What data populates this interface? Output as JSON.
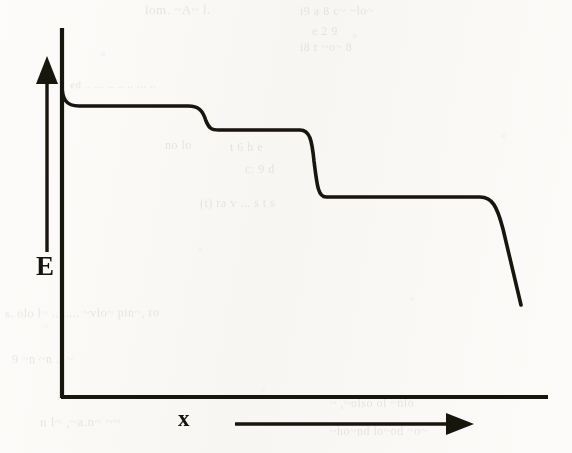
{
  "figure": {
    "kind": "hand-drawn-scanned-plot",
    "background_color": "#fbfaf8",
    "ink_color": "#17140f"
  },
  "axes": {
    "y_label": "E",
    "x_label": "x",
    "y_axis_arrow": "up-arrow-icon",
    "x_axis_arrow": "right-arrow-icon"
  },
  "ghost_text": [
    {
      "text": "lom. ~A~ l.",
      "left": 145,
      "top": 2,
      "size": 13,
      "rot": -0.6
    },
    {
      "text": "i9    a    8      c~    ~lo~",
      "left": 300,
      "top": 4,
      "size": 12,
      "rot": -0.4
    },
    {
      "text": "e    2    9",
      "left": 312,
      "top": 24,
      "size": 12,
      "rot": -0.5
    },
    {
      "text": "i8    r    ~o~    8",
      "left": 300,
      "top": 40,
      "size": 12,
      "rot": -0.3
    },
    {
      "text": "ed  ..   ...  .. ..   ..  ...  ..",
      "left": 70,
      "top": 78,
      "size": 11,
      "rot": -0.5
    },
    {
      "text": "no    lo",
      "left": 165,
      "top": 138,
      "size": 12,
      "rot": -0.4
    },
    {
      "text": "t     6     h     e",
      "left": 230,
      "top": 140,
      "size": 12,
      "rot": -0.4
    },
    {
      "text": "c:    9     d",
      "left": 245,
      "top": 162,
      "size": 12,
      "rot": -0.4
    },
    {
      "text": "(t)     ra    v    ...  s   t     s",
      "left": 200,
      "top": 196,
      "size": 12,
      "rot": -0.4
    },
    {
      "text": "s.    olo     l~ ........ ~vlo~     pin~, ro",
      "left": 5,
      "top": 306,
      "size": 12,
      "rot": -0.5
    },
    {
      "text": "9   ~n   ~n    ..    ~",
      "left": 12,
      "top": 352,
      "size": 12,
      "rot": -0.4
    },
    {
      "text": "~ ,~olso  ol  ~nlo",
      "left": 330,
      "top": 396,
      "size": 12,
      "rot": -0.4
    },
    {
      "text": "n l~   ,~a.n~ ~~",
      "left": 40,
      "top": 414,
      "size": 13,
      "rot": -0.5
    },
    {
      "text": "~ho~nd  lo~od  ~o~",
      "left": 330,
      "top": 424,
      "size": 12,
      "rot": -0.4
    }
  ],
  "chart_data": {
    "type": "line",
    "title": "",
    "xlabel": "x",
    "ylabel": "E",
    "grid": false,
    "legend_position": "none",
    "axis_ranges": {
      "x": [
        0,
        1
      ],
      "y": [
        0,
        1
      ]
    },
    "plateau_levels_normalized": [
      0.96,
      0.88,
      0.66
    ],
    "x": [
      0.0,
      0.02,
      0.04,
      0.07,
      0.3,
      0.38,
      0.43,
      0.46,
      0.66,
      0.71,
      0.74,
      0.76,
      0.86,
      0.91,
      0.94,
      0.95
    ],
    "y": [
      1.0,
      0.99,
      0.975,
      0.96,
      0.96,
      0.945,
      0.9,
      0.88,
      0.88,
      0.84,
      0.72,
      0.66,
      0.66,
      0.64,
      0.5,
      0.34
    ],
    "series": [
      {
        "name": "E(x)",
        "x": [
          0.0,
          0.02,
          0.04,
          0.07,
          0.3,
          0.38,
          0.43,
          0.46,
          0.66,
          0.71,
          0.74,
          0.76,
          0.86,
          0.91,
          0.94,
          0.95
        ],
        "values": [
          1.0,
          0.99,
          0.975,
          0.96,
          0.96,
          0.945,
          0.9,
          0.88,
          0.88,
          0.84,
          0.72,
          0.66,
          0.66,
          0.64,
          0.5,
          0.34
        ]
      }
    ],
    "steps": [
      {
        "index": 1,
        "x_normalized": 0.3,
        "from_level": 0.96,
        "to_level": 0.88
      },
      {
        "index": 2,
        "x_normalized": 0.5,
        "from_level": 0.88,
        "to_level": 0.66
      },
      {
        "index": 3,
        "x_normalized": 0.87,
        "from_level": 0.66,
        "to_level": 0.34
      }
    ],
    "pixel_path": {
      "y_axis_x": 62,
      "y_axis_top": 28,
      "x_axis_y": 398,
      "x_axis_right": 548,
      "curve": "M 62,85 C 62,100 66,106 78,106 L 188,106 C 200,106 204,112 207,122 C 209,128 211,130 218,130 L 300,130 C 310,130 312,140 314,160 C 317,184 318,197 325,197 L 480,197 C 492,197 497,205 503,228 C 512,262 517,288 521,305"
    }
  }
}
